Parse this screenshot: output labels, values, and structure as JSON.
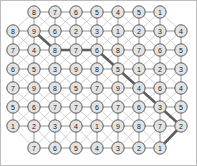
{
  "diagram": {
    "title": "",
    "type": "lattice-graph-with-highlighted-path",
    "canvas": {
      "width": 197,
      "height": 166
    },
    "colors": {
      "node_fill": "#e3e3e3",
      "node_stroke": "#4a4a4a",
      "edge": "#9a9a9a",
      "edge_faint": "#c4c4c4",
      "path_highlight": "#5e5e5e",
      "background": "#ffffff",
      "border": "#bdbdbd"
    },
    "layout": {
      "column_spacing": 21,
      "row_spacing": 18.3,
      "node_radius": 6.2,
      "offset_rows": [
        0,
        7
      ],
      "row_offset_x": 10.5
    },
    "rows": [
      {
        "index": 0,
        "offset": true,
        "x_start": 34,
        "y": 12,
        "values": [
          8,
          7,
          6,
          5,
          4,
          5,
          1
        ]
      },
      {
        "index": 1,
        "offset": false,
        "x_start": 13,
        "y": 31,
        "values": [
          8,
          9,
          6,
          2,
          3,
          1,
          2,
          3,
          4
        ]
      },
      {
        "index": 2,
        "offset": false,
        "x_start": 13,
        "y": 50,
        "values": [
          7,
          4,
          8,
          7,
          6,
          8,
          7,
          6,
          5
        ]
      },
      {
        "index": 3,
        "offset": false,
        "x_start": 13,
        "y": 69,
        "values": [
          6,
          5,
          3,
          9,
          8,
          5,
          1,
          2,
          3
        ]
      },
      {
        "index": 4,
        "offset": false,
        "x_start": 13,
        "y": 88,
        "values": [
          7,
          9,
          8,
          5,
          7,
          9,
          4,
          6,
          4
        ]
      },
      {
        "index": 5,
        "offset": false,
        "x_start": 13,
        "y": 107,
        "values": [
          5,
          6,
          7,
          7,
          6,
          7,
          6,
          3,
          5
        ]
      },
      {
        "index": 6,
        "offset": false,
        "x_start": 13,
        "y": 126,
        "values": [
          1,
          2,
          3,
          4,
          1,
          9,
          8,
          7,
          2
        ]
      },
      {
        "index": 7,
        "offset": true,
        "x_start": 34,
        "y": 148,
        "values": [
          7,
          6,
          5,
          4,
          3,
          2,
          1
        ]
      }
    ],
    "highlighted_path": {
      "label": "shortest-path",
      "nodes": [
        {
          "row": 1,
          "col": 1,
          "value": 9
        },
        {
          "row": 2,
          "col": 2,
          "value": 8
        },
        {
          "row": 2,
          "col": 3,
          "value": 7
        },
        {
          "row": 2,
          "col": 4,
          "value": 6
        },
        {
          "row": 3,
          "col": 5,
          "value": 5
        },
        {
          "row": 4,
          "col": 6,
          "value": 4
        },
        {
          "row": 5,
          "col": 7,
          "value": 3
        },
        {
          "row": 6,
          "col": 8,
          "value": 2
        },
        {
          "row": 7,
          "col": 6,
          "value": 1
        }
      ],
      "value_sequence": [
        9,
        8,
        7,
        6,
        5,
        4,
        3,
        2,
        1
      ]
    }
  }
}
